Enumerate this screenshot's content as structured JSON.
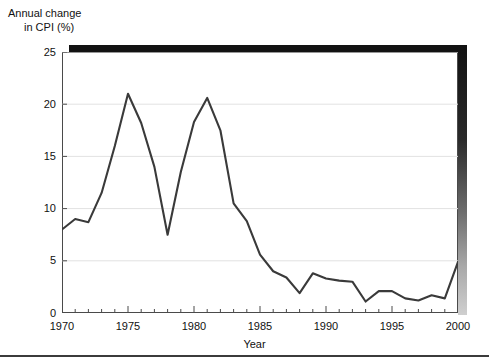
{
  "figure": {
    "y_axis_caption_line1": "Annual change",
    "y_axis_caption_line2": "in CPI (%)",
    "x_axis_caption": "Year"
  },
  "chart_data": {
    "type": "line",
    "title": "",
    "subtitle": "",
    "xlabel": "Year",
    "ylabel": "Annual change in CPI (%)",
    "xlim": [
      1970,
      2000
    ],
    "ylim": [
      0,
      25
    ],
    "grid": "horizontal",
    "legend": "none",
    "line_color": "#3a3a3a",
    "x": [
      1970,
      1971,
      1972,
      1973,
      1974,
      1975,
      1976,
      1977,
      1978,
      1979,
      1980,
      1981,
      1982,
      1983,
      1984,
      1985,
      1986,
      1987,
      1988,
      1989,
      1990,
      1991,
      1992,
      1993,
      1994,
      1995,
      1996,
      1997,
      1998,
      1999,
      2000
    ],
    "values": [
      8.0,
      9.0,
      8.7,
      11.5,
      16.0,
      21.0,
      18.2,
      14.0,
      7.5,
      13.5,
      18.3,
      20.6,
      17.5,
      10.5,
      8.8,
      5.6,
      4.0,
      3.4,
      1.9,
      3.8,
      3.3,
      3.1,
      3.0,
      1.1,
      2.1,
      2.1,
      1.4,
      1.2,
      1.7,
      1.4,
      4.9
    ],
    "series": [
      {
        "name": "Annual change in CPI (%)",
        "values": [
          8.0,
          9.0,
          8.7,
          11.5,
          16.0,
          21.0,
          18.2,
          14.0,
          7.5,
          13.5,
          18.3,
          20.6,
          17.5,
          10.5,
          8.8,
          5.6,
          4.0,
          3.4,
          1.9,
          3.8,
          3.3,
          3.1,
          3.0,
          1.1,
          2.1,
          2.1,
          1.4,
          1.2,
          1.7,
          1.4,
          4.9
        ]
      }
    ],
    "y_ticks": [
      0,
      5,
      10,
      15,
      20,
      25
    ],
    "y_tick_labels": [
      "0",
      "5",
      "10",
      "15",
      "20",
      "25"
    ],
    "x_ticks": [
      1970,
      1975,
      1980,
      1985,
      1990,
      1995,
      2000
    ],
    "x_tick_labels": [
      "1970",
      "1975",
      "1980",
      "1985",
      "1990",
      "1995",
      "2000"
    ],
    "x_minor_tick_step": 1
  }
}
